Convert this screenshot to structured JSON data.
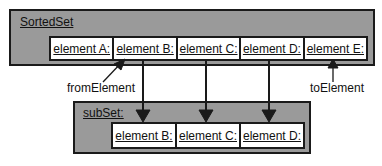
{
  "sorted_set": {
    "label": "SortedSet",
    "elements": [
      "element A:",
      "element B:",
      "element C:",
      "element D:",
      "element E:"
    ]
  },
  "sub_set": {
    "label": "subSet:",
    "elements": [
      "element B:",
      "element C:",
      "element D:"
    ]
  },
  "annotations": {
    "from_element": "fromElement",
    "to_element": "toElement"
  },
  "colors": {
    "box_fill": "#9a9a9a",
    "border": "#1a1a1a",
    "cell_fill": "#ffffff"
  }
}
